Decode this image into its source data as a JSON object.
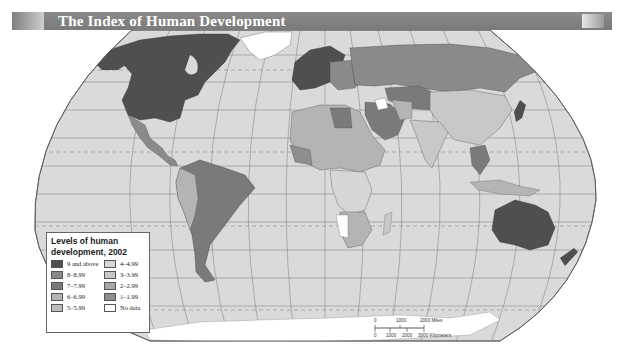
{
  "title": "The Index of Human Development",
  "map": {
    "projection": "Robinson-style world map",
    "ocean_color": "#d9d9d9",
    "graticule_color": "#777777",
    "highlighted_regions": [
      {
        "name": "North America (USA & Canada)",
        "level": "9 and above"
      },
      {
        "name": "Australia",
        "level": "9 and above"
      },
      {
        "name": "Western Europe",
        "level": "9 and above"
      },
      {
        "name": "Greenland",
        "level": "No data"
      },
      {
        "name": "Russia",
        "level": "7-7.99"
      },
      {
        "name": "China",
        "level": "4-4.99"
      },
      {
        "name": "Brazil",
        "level": "7-7.99"
      },
      {
        "name": "Mexico",
        "level": "7-7.99"
      },
      {
        "name": "Antarctica",
        "level": "No data"
      }
    ]
  },
  "legend": {
    "title_line1": "Levels of human",
    "title_line2": "development, 2002",
    "items": [
      {
        "label": "9 and above",
        "color": "#4f4f4f"
      },
      {
        "label": "4–4.99",
        "color": "#d6d6d6"
      },
      {
        "label": "8–8.99",
        "color": "#8a8a8a"
      },
      {
        "label": "3–3.99",
        "color": "#c8c8c8"
      },
      {
        "label": "7–7.99",
        "color": "#7a7a7a"
      },
      {
        "label": "2–2.99",
        "color": "#a8a8a8"
      },
      {
        "label": "6–6.99",
        "color": "#b4b4b4"
      },
      {
        "label": "1–1.99",
        "color": "#8e8e8e"
      },
      {
        "label": "5–5.99",
        "color": "#bcbcbc"
      },
      {
        "label": "No data",
        "color": "#ffffff"
      }
    ]
  },
  "scale_bar": {
    "miles_ticks": [
      "0",
      "1000",
      "2000 Miles"
    ],
    "km_ticks": [
      "0",
      "1000",
      "2000",
      "3000 Kilometers"
    ]
  }
}
